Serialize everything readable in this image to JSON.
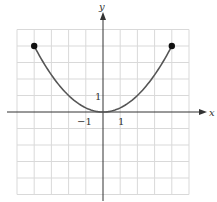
{
  "chart_data": {
    "type": "line",
    "title": "",
    "xlabel": "x",
    "ylabel": "y",
    "xlim": [
      -5,
      5
    ],
    "ylim": [
      -5,
      5
    ],
    "grid": true,
    "tick_labels": {
      "x": [
        "-1",
        "1"
      ],
      "y": [
        "1"
      ]
    },
    "series": [
      {
        "name": "y = x^2/4",
        "x": [
          -4,
          -3,
          -2,
          -1,
          0,
          1,
          2,
          3,
          4
        ],
        "y": [
          4,
          2.25,
          1,
          0.25,
          0,
          0.25,
          1,
          2.25,
          4
        ]
      }
    ],
    "endpoints": [
      {
        "x": -4,
        "y": 4,
        "style": "closed"
      },
      {
        "x": 4,
        "y": 4,
        "style": "closed"
      }
    ]
  },
  "labels": {
    "x_axis": "x",
    "y_axis": "y",
    "x_tick_neg1": "−1",
    "x_tick_1": "1",
    "y_tick_1": "1"
  },
  "colors": {
    "grid": "#d9d9d9",
    "axis": "#333333",
    "curve": "#555555",
    "point": "#111111"
  }
}
